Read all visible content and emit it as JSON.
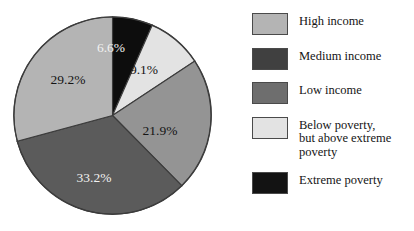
{
  "chart_data": {
    "type": "pie",
    "title": "",
    "subtitle": "",
    "xlabel": "",
    "ylabel": "",
    "grid": false,
    "legend_position": "right",
    "units": "percent",
    "start_angle_deg": 0,
    "direction": "clockwise",
    "categories": [
      "Extreme poverty",
      "Below poverty, but above extreme poverty",
      "Low income",
      "Medium income",
      "High income"
    ],
    "values": [
      6.6,
      9.1,
      21.9,
      33.2,
      29.2
    ],
    "slices": [
      {
        "key": "extreme-poverty",
        "label": "Extreme poverty",
        "value": 6.6,
        "data_label": "6.6%",
        "color": "#0d0d0d",
        "label_color": "light",
        "label_x": 98,
        "label_y": 36
      },
      {
        "key": "below-poverty",
        "label": "Below poverty,\nbut above extreme poverty",
        "value": 9.1,
        "data_label": "9.1%",
        "color": "#e3e3e3",
        "label_color": "dark",
        "label_x": 131,
        "label_y": 58
      },
      {
        "key": "low-income",
        "label": "Low income",
        "value": 21.9,
        "data_label": "21.9%",
        "color": "#949494",
        "label_color": "dark",
        "label_x": 147,
        "label_y": 119
      },
      {
        "key": "medium-income",
        "label": "Medium income",
        "value": 33.2,
        "data_label": "33.2%",
        "color": "#5b5b5b",
        "label_color": "light",
        "label_x": 81,
        "label_y": 166
      },
      {
        "key": "high-income",
        "label": "High income",
        "value": 29.2,
        "data_label": "29.2%",
        "color": "#b4b4b4",
        "label_color": "dark",
        "label_x": 55,
        "label_y": 68
      }
    ]
  },
  "legend": {
    "items": [
      {
        "label": "High income",
        "color": "#b4b4b4",
        "value": 29.2
      },
      {
        "label": "Medium income",
        "color": "#404040",
        "value": 33.2
      },
      {
        "label": "Low income",
        "color": "#6e6e6e",
        "value": 21.9
      },
      {
        "label": "Below poverty,\nbut above extreme poverty",
        "color": "#e3e3e3",
        "value": 9.1
      },
      {
        "label": "Extreme poverty",
        "color": "#131313",
        "value": 6.6
      }
    ]
  },
  "colors": {
    "background": "#ffffff",
    "outline": "#3c3c3c",
    "text": "#151515",
    "label_light": "#f2f2f2",
    "label_dark": "#141414"
  }
}
